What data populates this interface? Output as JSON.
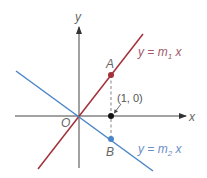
{
  "diagram": {
    "type": "coordinate-plane",
    "axes": {
      "x_label": "x",
      "y_label": "y",
      "origin_label": "O",
      "axis_color": "#333333"
    },
    "lines": [
      {
        "id": "line1",
        "equation_prefix": "y = m",
        "subscript": "1",
        "equation_suffix": " x",
        "color": "#a3303a"
      },
      {
        "id": "line2",
        "equation_prefix": "y = m",
        "subscript": "2",
        "equation_suffix": " x",
        "color": "#4a86c8"
      }
    ],
    "points": [
      {
        "id": "A",
        "label": "A",
        "color": "#a3303a"
      },
      {
        "id": "B",
        "label": "B",
        "color": "#4a86c8"
      },
      {
        "id": "unit",
        "label": "(1, 0)",
        "color": "#111111"
      }
    ],
    "label_color": "#666666"
  }
}
